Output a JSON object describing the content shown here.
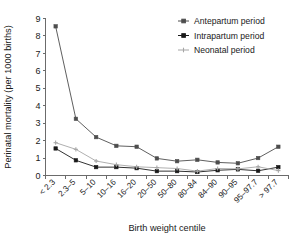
{
  "chart_data": {
    "type": "line",
    "title": "",
    "xlabel": "Birth weight centile",
    "ylabel": "Perinatal mortality (per 1000 births)",
    "categories": [
      "< 2.3",
      "2.3–5",
      "5–10",
      "10–16",
      "16–20",
      "20–50",
      "50–80",
      "80–84",
      "84–90",
      "90–95",
      "95–97.7",
      "> 97.7"
    ],
    "yticks": [
      "0",
      "1",
      "2",
      "3",
      "4",
      "5",
      "6",
      "7",
      "8",
      "9"
    ],
    "ylim": [
      0,
      9
    ],
    "grid": false,
    "legend_position": "top-right",
    "series": [
      {
        "name": "Antepartum period",
        "color": "#4d4d4d",
        "marker": "square",
        "values": [
          8.55,
          3.25,
          2.2,
          1.7,
          1.65,
          0.98,
          0.82,
          0.9,
          0.75,
          0.7,
          1.0,
          1.65
        ]
      },
      {
        "name": "Intrapartum period",
        "color": "#1a1a1a",
        "marker": "square",
        "values": [
          1.55,
          0.87,
          0.48,
          0.48,
          0.42,
          0.25,
          0.25,
          0.2,
          0.3,
          0.35,
          0.27,
          0.48
        ]
      },
      {
        "name": "Neonatal period",
        "color": "#a6a6a6",
        "marker": "plus",
        "values": [
          1.88,
          1.5,
          0.83,
          0.62,
          0.5,
          0.45,
          0.4,
          0.25,
          0.4,
          0.38,
          0.5,
          0.28
        ]
      }
    ]
  }
}
